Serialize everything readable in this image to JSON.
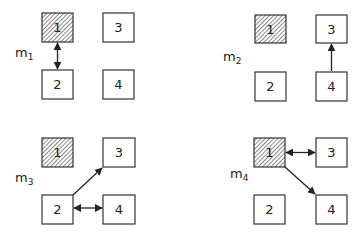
{
  "diagram": {
    "panels": [
      {
        "label": "m",
        "subscript": "1",
        "nodes": [
          {
            "id": "1",
            "label": "1",
            "hatched": true
          },
          {
            "id": "2",
            "label": "2",
            "hatched": false
          },
          {
            "id": "3",
            "label": "3",
            "hatched": false
          },
          {
            "id": "4",
            "label": "4",
            "hatched": false
          }
        ],
        "edges": [
          {
            "from": "1",
            "to": "2",
            "type": "bidirectional"
          }
        ]
      },
      {
        "label": "m",
        "subscript": "2",
        "nodes": [
          {
            "id": "1",
            "label": "1",
            "hatched": true
          },
          {
            "id": "2",
            "label": "2",
            "hatched": false
          },
          {
            "id": "3",
            "label": "3",
            "hatched": false
          },
          {
            "id": "4",
            "label": "4",
            "hatched": false
          }
        ],
        "edges": [
          {
            "from": "4",
            "to": "3",
            "type": "directed"
          }
        ]
      },
      {
        "label": "m",
        "subscript": "3",
        "nodes": [
          {
            "id": "1",
            "label": "1",
            "hatched": true
          },
          {
            "id": "2",
            "label": "2",
            "hatched": false
          },
          {
            "id": "3",
            "label": "3",
            "hatched": false
          },
          {
            "id": "4",
            "label": "4",
            "hatched": false
          }
        ],
        "edges": [
          {
            "from": "2",
            "to": "3",
            "type": "directed"
          },
          {
            "from": "2",
            "to": "4",
            "type": "bidirectional"
          }
        ]
      },
      {
        "label": "m",
        "subscript": "4",
        "nodes": [
          {
            "id": "1",
            "label": "1",
            "hatched": true
          },
          {
            "id": "2",
            "label": "2",
            "hatched": false
          },
          {
            "id": "3",
            "label": "3",
            "hatched": false
          },
          {
            "id": "4",
            "label": "4",
            "hatched": false
          }
        ],
        "edges": [
          {
            "from": "1",
            "to": "3",
            "type": "bidirectional"
          },
          {
            "from": "1",
            "to": "4",
            "type": "directed"
          }
        ]
      }
    ],
    "colors": {
      "stroke": "#333333",
      "hatch": "#555555",
      "background": "#ffffff"
    }
  }
}
